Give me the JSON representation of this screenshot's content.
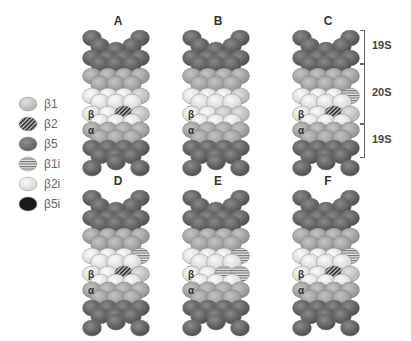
{
  "figure": {
    "legend": {
      "items": [
        {
          "label": "β1",
          "fill": "#bdbdbd",
          "pattern": "solid"
        },
        {
          "label": "β2",
          "fill": "#333333",
          "pattern": "diag"
        },
        {
          "label": "β5",
          "fill": "#6b6b6b",
          "pattern": "solid"
        },
        {
          "label": "β1i",
          "fill": "#9a9a9a",
          "pattern": "horiz"
        },
        {
          "label": "β2i",
          "fill": "#eeeeee",
          "pattern": "solid"
        },
        {
          "label": "β5i",
          "fill": "#1a1a1a",
          "pattern": "dots"
        }
      ]
    },
    "panels": [
      {
        "label": "A",
        "x": 80,
        "y": 14,
        "beta_top_right": "b1",
        "beta_mid_right": "b2",
        "immuno": false
      },
      {
        "label": "B",
        "x": 180,
        "y": 14,
        "beta_top_right": "b1",
        "beta_mid_right": "b1",
        "immuno": false
      },
      {
        "label": "C",
        "x": 290,
        "y": 14,
        "beta_top_right": "b1i",
        "beta_mid_right": "b2",
        "immuno": false
      },
      {
        "label": "D",
        "x": 80,
        "y": 174,
        "beta_top_right": "b1i",
        "beta_mid_right": "b2",
        "immuno": true
      },
      {
        "label": "E",
        "x": 180,
        "y": 174,
        "beta_top_right": "b1i",
        "beta_mid_right": "b1i",
        "immuno": true
      },
      {
        "label": "F",
        "x": 290,
        "y": 174,
        "beta_top_right": "b1i",
        "beta_mid_right": "b2",
        "immuno": true
      }
    ],
    "ring_labels": {
      "beta": "β",
      "alpha": "α"
    },
    "brackets": [
      {
        "label": "19S",
        "top": 30,
        "height": 32
      },
      {
        "label": "20S",
        "top": 64,
        "height": 58
      },
      {
        "label": "19S",
        "top": 124,
        "height": 32
      }
    ]
  }
}
